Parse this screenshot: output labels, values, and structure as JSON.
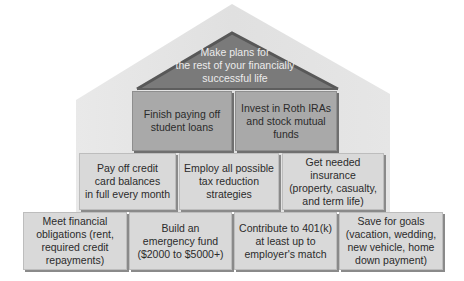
{
  "diagram": {
    "type": "house-pyramid",
    "colors": {
      "house_background": "#e3e3e3",
      "roof_triangle": "#7a7a7a",
      "roof_edge": "#5a5a5a",
      "row1_fill": "#a9a9a9",
      "row2_fill": "#d9d9d9",
      "row3_fill": "#d9d9d9",
      "roof_text": "#ececec",
      "box_text": "#2b2b2b"
    },
    "roof": {
      "lines": [
        "Make plans for",
        "the rest of your financially",
        "successful life"
      ]
    },
    "rows": [
      {
        "level": 1,
        "boxes": [
          {
            "lines": [
              "Finish paying off",
              "student loans"
            ]
          },
          {
            "lines": [
              "Invest in Roth IRAs",
              "and stock mutual",
              "funds"
            ]
          }
        ]
      },
      {
        "level": 2,
        "boxes": [
          {
            "lines": [
              "Pay off credit",
              "card balances",
              "in full every month"
            ]
          },
          {
            "lines": [
              "Employ all possible",
              "tax reduction",
              "strategies"
            ]
          },
          {
            "lines": [
              "Get needed insurance",
              "(property, casualty,",
              "and term life)"
            ]
          }
        ]
      },
      {
        "level": 3,
        "boxes": [
          {
            "lines": [
              "Meet financial",
              "obligations (rent,",
              "required credit",
              "repayments)"
            ]
          },
          {
            "lines": [
              "Build an",
              "emergency fund",
              "($2000 to $5000+)"
            ]
          },
          {
            "lines": [
              "Contribute to 401(k)",
              "at least up to",
              "employer's match"
            ]
          },
          {
            "lines": [
              "Save for goals",
              "(vacation, wedding,",
              "new vehicle, home",
              "down payment)"
            ]
          }
        ]
      }
    ]
  }
}
